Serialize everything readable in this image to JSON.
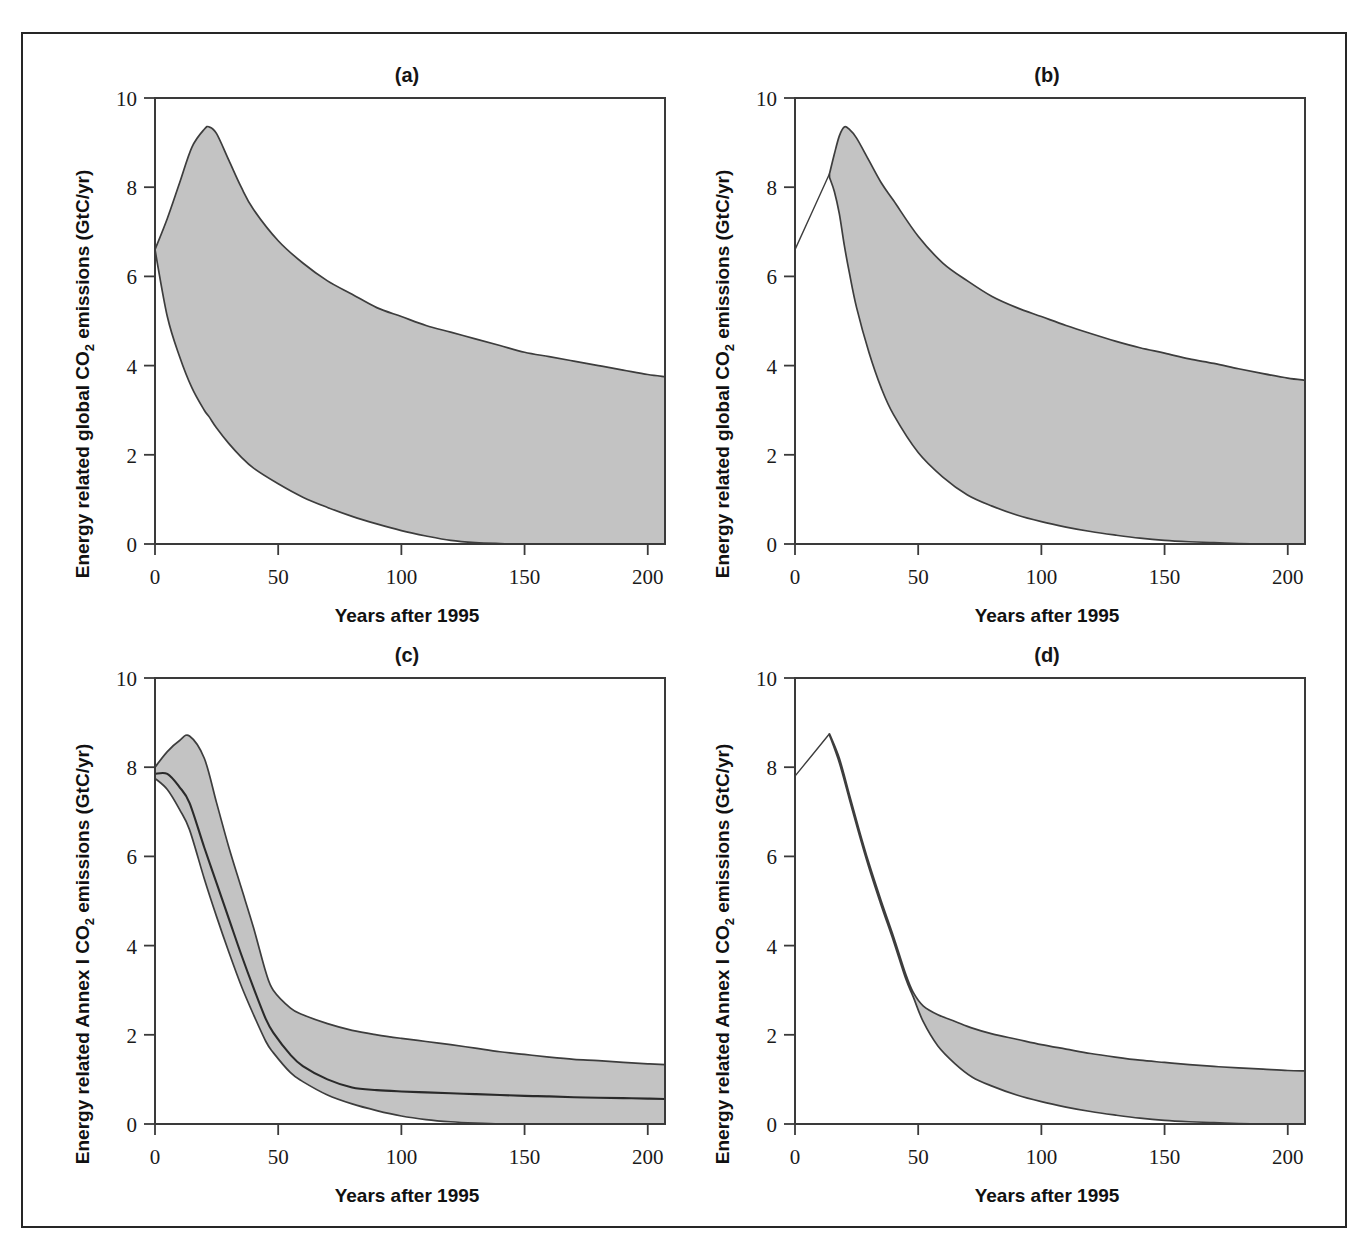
{
  "figure": {
    "name": "co2-emissions-ranges-figure",
    "border_color": "#262626",
    "band_fill_color": "#c3c3c3",
    "line_color": "#3d3d3d"
  },
  "axis": {
    "x_title": "Years after 1995",
    "x_ticks": [
      "0",
      "50",
      "100",
      "150",
      "200"
    ],
    "x_tick_values": [
      0,
      50,
      100,
      150,
      200
    ],
    "x_min": 0,
    "x_max": 207,
    "y_ticks": [
      "0",
      "2",
      "4",
      "6",
      "8",
      "10"
    ],
    "y_tick_values": [
      0,
      2,
      4,
      6,
      8,
      10
    ],
    "y_min": 0,
    "y_max": 10,
    "y_title_global": "Energy related global CO2 emissions (GtC/yr)",
    "y_title_annex": "Energy related Annex I CO2 emissions (GtC/yr)",
    "y_title_global_parts": [
      "Energy related global CO",
      "2",
      " emissions (GtC/yr)"
    ],
    "y_title_annex_parts": [
      "Energy related Annex I CO",
      "2",
      " emissions (GtC/yr)"
    ]
  },
  "chart_data": [
    {
      "id": "panel-a",
      "type": "area",
      "title": "(a)",
      "xlabel": "Years after 1995",
      "ylabel": "Energy related global CO2 emissions (GtC/yr)",
      "xlim": [
        0,
        207
      ],
      "ylim": [
        0,
        10
      ],
      "grid": false,
      "legend": "none",
      "x": [
        0,
        5,
        10,
        15,
        20,
        22,
        25,
        30,
        35,
        40,
        50,
        60,
        70,
        80,
        90,
        100,
        110,
        120,
        130,
        140,
        150,
        160,
        170,
        180,
        190,
        200,
        207
      ],
      "series": [
        {
          "name": "upper bound",
          "values": [
            6.6,
            7.3,
            8.1,
            8.9,
            9.3,
            9.35,
            9.2,
            8.6,
            8.0,
            7.5,
            6.8,
            6.3,
            5.9,
            5.6,
            5.3,
            5.1,
            4.9,
            4.75,
            4.6,
            4.45,
            4.3,
            4.2,
            4.1,
            4.0,
            3.9,
            3.8,
            3.75
          ]
        },
        {
          "name": "lower bound",
          "values": [
            6.6,
            5.1,
            4.2,
            3.5,
            3.0,
            2.85,
            2.6,
            2.25,
            1.95,
            1.7,
            1.35,
            1.05,
            0.82,
            0.62,
            0.45,
            0.3,
            0.18,
            0.08,
            0.03,
            0.01,
            0.0,
            0.0,
            0.0,
            0.0,
            0.0,
            0.0,
            0.0
          ]
        }
      ]
    },
    {
      "id": "panel-b",
      "type": "area",
      "title": "(b)",
      "xlabel": "Years after 1995",
      "ylabel": "Energy related global CO2 emissions (GtC/yr)",
      "xlim": [
        0,
        207
      ],
      "ylim": [
        0,
        10
      ],
      "grid": false,
      "legend": "none",
      "lead_in_line": {
        "x": [
          0,
          14
        ],
        "y": [
          6.6,
          8.3
        ]
      },
      "x": [
        14,
        16,
        18,
        20,
        22,
        25,
        30,
        35,
        40,
        50,
        60,
        70,
        80,
        90,
        100,
        110,
        120,
        130,
        140,
        150,
        160,
        170,
        180,
        190,
        200,
        207
      ],
      "series": [
        {
          "name": "upper bound",
          "values": [
            8.3,
            8.75,
            9.15,
            9.35,
            9.3,
            9.1,
            8.6,
            8.1,
            7.7,
            6.9,
            6.3,
            5.9,
            5.55,
            5.3,
            5.1,
            4.9,
            4.72,
            4.55,
            4.4,
            4.28,
            4.15,
            4.05,
            3.93,
            3.82,
            3.72,
            3.67
          ]
        },
        {
          "name": "lower bound",
          "values": [
            8.22,
            7.9,
            7.4,
            6.7,
            6.1,
            5.3,
            4.3,
            3.5,
            2.9,
            2.05,
            1.5,
            1.1,
            0.85,
            0.65,
            0.5,
            0.38,
            0.28,
            0.2,
            0.13,
            0.08,
            0.05,
            0.03,
            0.01,
            0.0,
            0.0,
            0.0
          ]
        }
      ]
    },
    {
      "id": "panel-c",
      "type": "area",
      "title": "(c)",
      "xlabel": "Years after 1995",
      "ylabel": "Energy related Annex I CO2 emissions (GtC/yr)",
      "xlim": [
        0,
        207
      ],
      "ylim": [
        0,
        10
      ],
      "grid": false,
      "legend": "none",
      "has_median": true,
      "x": [
        0,
        5,
        10,
        14,
        20,
        25,
        30,
        35,
        40,
        45,
        48,
        55,
        60,
        70,
        80,
        90,
        100,
        110,
        120,
        130,
        140,
        150,
        160,
        170,
        180,
        190,
        200,
        207
      ],
      "series": [
        {
          "name": "upper bound",
          "values": [
            8.0,
            8.35,
            8.6,
            8.7,
            8.2,
            7.2,
            6.2,
            5.3,
            4.4,
            3.4,
            3.0,
            2.6,
            2.45,
            2.25,
            2.1,
            2.0,
            1.92,
            1.85,
            1.78,
            1.7,
            1.62,
            1.56,
            1.5,
            1.45,
            1.42,
            1.38,
            1.35,
            1.33
          ]
        },
        {
          "name": "median",
          "values": [
            7.85,
            7.85,
            7.55,
            7.2,
            6.2,
            5.4,
            4.6,
            3.8,
            3.05,
            2.35,
            2.05,
            1.55,
            1.3,
            1.0,
            0.82,
            0.76,
            0.73,
            0.71,
            0.69,
            0.67,
            0.65,
            0.63,
            0.62,
            0.6,
            0.59,
            0.58,
            0.57,
            0.56
          ]
        },
        {
          "name": "lower bound",
          "values": [
            7.75,
            7.5,
            7.05,
            6.6,
            5.5,
            4.65,
            3.85,
            3.1,
            2.45,
            1.85,
            1.6,
            1.15,
            0.95,
            0.65,
            0.45,
            0.3,
            0.18,
            0.1,
            0.05,
            0.02,
            0.0,
            0.0,
            0.0,
            0.0,
            0.0,
            0.0,
            0.0,
            0.0
          ]
        }
      ]
    },
    {
      "id": "panel-d",
      "type": "area",
      "title": "(d)",
      "xlabel": "Years after 1995",
      "ylabel": "Energy related Annex I CO2 emissions (GtC/yr)",
      "xlim": [
        0,
        207
      ],
      "ylim": [
        0,
        10
      ],
      "grid": false,
      "legend": "none",
      "lead_in_line": {
        "x": [
          0,
          14
        ],
        "y": [
          7.8,
          8.75
        ]
      },
      "x": [
        14,
        18,
        22,
        26,
        30,
        35,
        40,
        45,
        48,
        52,
        58,
        65,
        72,
        80,
        90,
        100,
        110,
        120,
        130,
        140,
        150,
        160,
        170,
        180,
        190,
        200,
        207
      ],
      "series": [
        {
          "name": "upper bound",
          "values": [
            8.75,
            8.2,
            7.4,
            6.6,
            5.85,
            5.0,
            4.2,
            3.35,
            2.95,
            2.65,
            2.45,
            2.3,
            2.15,
            2.02,
            1.9,
            1.78,
            1.68,
            1.58,
            1.5,
            1.43,
            1.38,
            1.33,
            1.29,
            1.26,
            1.23,
            1.2,
            1.19
          ]
        },
        {
          "name": "lower bound",
          "values": [
            8.72,
            8.1,
            7.3,
            6.5,
            5.75,
            4.9,
            4.1,
            3.25,
            2.85,
            2.3,
            1.75,
            1.35,
            1.05,
            0.85,
            0.65,
            0.5,
            0.38,
            0.28,
            0.2,
            0.13,
            0.08,
            0.05,
            0.03,
            0.01,
            0.0,
            0.0,
            0.0
          ]
        }
      ]
    }
  ]
}
